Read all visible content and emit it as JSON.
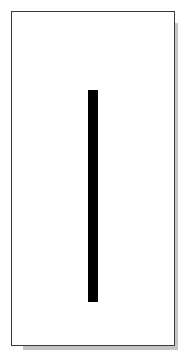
{
  "figure": {
    "shape": "vertical-bar",
    "bar_color": "#000000",
    "card_background": "#ffffff",
    "card_border_color": "#3a3a3a",
    "shadow_color": "#c4c4c4"
  }
}
